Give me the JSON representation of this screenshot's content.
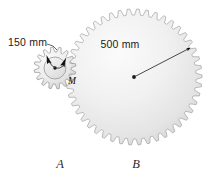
{
  "figure": {
    "background_color": "#ffffff",
    "gear_fill_light": "#f2f2f2",
    "gear_fill_dark": "#d8d8d8",
    "outline_color": "#8f8f8f",
    "text_color": "#1a1a1a"
  },
  "labels": {
    "gear_a_diameter": "150 mm",
    "gear_b_radius": "500 mm",
    "gear_a_name": "A",
    "gear_b_name": "B",
    "moment": "M"
  },
  "geometry": {
    "gear_a": {
      "center_x": 55,
      "center_y": 68,
      "root_radius": 16,
      "tip_radius": 21,
      "teeth": 16,
      "hub_radius": 11
    },
    "gear_b": {
      "center_x": 134,
      "center_y": 77,
      "root_radius": 62,
      "tip_radius": 68,
      "teeth": 46
    },
    "dimension_500mm": {
      "from_x": 134,
      "from_y": 77,
      "to_x": 190,
      "to_y": 48
    },
    "dimension_150mm": {
      "leader_from_x": 47,
      "leader_from_y": 44,
      "leader_to_x": 57,
      "leader_to_y": 50
    }
  },
  "annotations": {
    "rotation_arrow_count": 2,
    "moment_sense": "counterclockwise"
  }
}
